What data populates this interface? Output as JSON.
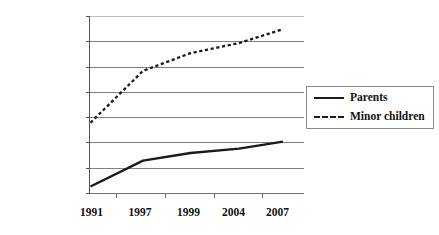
{
  "chart_data": {
    "type": "line",
    "title": "",
    "subtitle": "",
    "xlabel": "",
    "ylabel": "",
    "categories": [
      "1991",
      "1997",
      "1999",
      "2004",
      "2007"
    ],
    "x_tick_labels": [
      "1991",
      "1997",
      "1999",
      "2004",
      "2007"
    ],
    "y_tick_labels": [
      "1,800,000",
      "1,600,000",
      "1,400,000",
      "1,200,000",
      "1,000,000",
      "800,000",
      "600,000",
      "400,000"
    ],
    "y_tick_values": [
      1800000,
      1600000,
      1400000,
      1200000,
      1000000,
      800000,
      600000,
      400000
    ],
    "ylim": [
      400000,
      1800000
    ],
    "grid": true,
    "grid_axis": "y",
    "legend_position": "right",
    "series": [
      {
        "name": "Parents",
        "style": "solid",
        "color": "#1a1a1a",
        "values": [
          455000,
          660000,
          720000,
          755000,
          810000
        ]
      },
      {
        "name": "Minor children",
        "style": "dashed",
        "color": "#1a1a1a",
        "values": [
          960000,
          1370000,
          1510000,
          1590000,
          1700000
        ]
      }
    ]
  },
  "legend": {
    "items": [
      {
        "label": "Parents",
        "style": "solid"
      },
      {
        "label": "Minor children",
        "style": "dashed"
      }
    ]
  },
  "colors": {
    "line": "#1a1a1a",
    "grid": "#808080",
    "axis": "#707070",
    "text": "#111111",
    "background": "#ffffff"
  }
}
